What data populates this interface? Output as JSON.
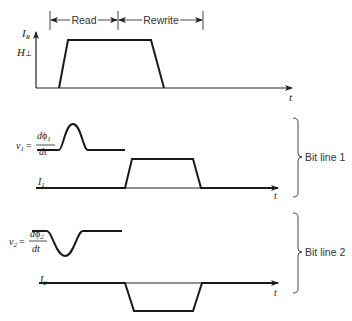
{
  "diagram": {
    "type": "timing-diagram",
    "phases": [
      {
        "label": "Read",
        "x_start": 50,
        "x_end": 118
      },
      {
        "label": "Rewrite",
        "x_start": 118,
        "x_end": 203
      }
    ],
    "top_plot": {
      "y_axis_label_main": "I",
      "y_axis_label_sub": "R",
      "threshold_label_main": "H",
      "threshold_label_sub": "⊥",
      "x_axis_label": "t",
      "signal": "I_R trapezoid pulse spanning Read and Rewrite"
    },
    "bit_line_1": {
      "label": "Bit line 1",
      "v_label": "v",
      "v_sub": "1",
      "eq": "=",
      "num_d": "d",
      "num_phi": "ϕ",
      "num_sub": "1",
      "den": "dt",
      "i_label": "I",
      "i_sub": "1",
      "x_axis_label": "t",
      "v_signal": "positive bump during Read",
      "i_signal": "positive pulse during Rewrite"
    },
    "bit_line_2": {
      "label": "Bit line 2",
      "v_label": "v",
      "v_sub": "2",
      "eq": "=",
      "num_d": "d",
      "num_phi": "ϕ",
      "num_sub": "2",
      "den": "dt",
      "i_label": "I",
      "i_sub": "2",
      "x_axis_label": "t",
      "v_signal": "negative dip during Read",
      "i_signal": "negative pulse during Rewrite"
    },
    "colors": {
      "stroke": "#1a1a1a",
      "text": "#333333",
      "background": "#ffffff"
    }
  }
}
